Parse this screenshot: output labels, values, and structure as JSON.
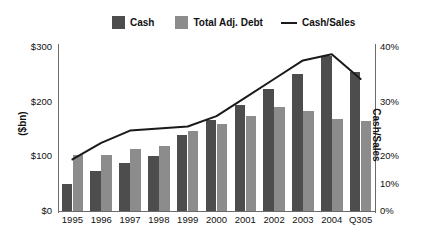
{
  "chart_data": {
    "type": "bar",
    "title": "",
    "xlabel": "",
    "ylabel": "($bn)",
    "y2label": "Cash/Sales",
    "categories": [
      "1995",
      "1996",
      "1997",
      "1998",
      "1999",
      "2000",
      "2001",
      "2002",
      "2003",
      "2004",
      "Q305"
    ],
    "ylim": [
      0,
      300
    ],
    "y2lim": [
      0,
      40
    ],
    "yticks": [
      "$0",
      "$100",
      "$200",
      "$300"
    ],
    "ytick_values": [
      0,
      100,
      200,
      300
    ],
    "y2ticks": [
      "0%",
      "10%",
      "20%",
      "30%",
      "40%"
    ],
    "y2tick_values": [
      0,
      10,
      20,
      30,
      40
    ],
    "grid": false,
    "legend_position": "top",
    "series": [
      {
        "name": "Cash",
        "type": "bar",
        "axis": "left",
        "color": "#4d4d4d",
        "values": [
          50,
          72,
          88,
          100,
          138,
          165,
          193,
          221,
          250,
          282,
          253
        ]
      },
      {
        "name": "Total Adj. Debt",
        "type": "bar",
        "axis": "left",
        "color": "#8c8c8c",
        "values": [
          101,
          101,
          113,
          118,
          146,
          158,
          173,
          190,
          181,
          168,
          163
        ]
      },
      {
        "name": "Cash/Sales",
        "type": "line",
        "axis": "right",
        "color": "#1a1a1a",
        "values": [
          12.5,
          16.5,
          19.5,
          20.0,
          20.5,
          23.0,
          27.5,
          32.0,
          36.5,
          38.0,
          32.0
        ]
      }
    ]
  },
  "legend": {
    "items": [
      {
        "label": "Cash",
        "marker": "square",
        "color": "#4d4d4d"
      },
      {
        "label": "Total Adj. Debt",
        "marker": "square",
        "color": "#8c8c8c"
      },
      {
        "label": "Cash/Sales",
        "marker": "line",
        "color": "#1a1a1a"
      }
    ]
  },
  "axes": {
    "left_title": "($bn)",
    "right_title": "Cash/Sales"
  }
}
